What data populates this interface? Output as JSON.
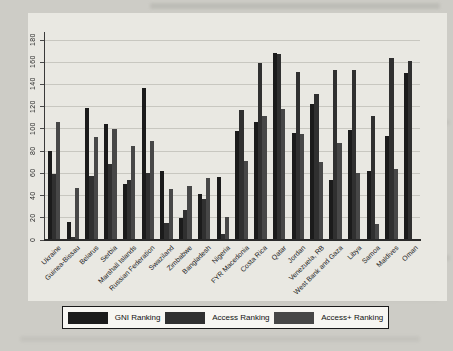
{
  "chart_data": {
    "type": "bar",
    "title": "",
    "xlabel": "",
    "ylabel": "",
    "categories": [
      "Ukraine",
      "Guinea-Bissau",
      "Belarus",
      "Serbia",
      "Marshall Islands",
      "Russian Federation",
      "Swaziland",
      "Zimbabwe",
      "Bangladesh",
      "Nigeria",
      "FYR Macedonia",
      "Costa Rica",
      "Qatar",
      "Jordan",
      "Venezuela, RB",
      "West Bank and Gaza",
      "Libya",
      "Samoa",
      "Maldives",
      "Oman"
    ],
    "series": [
      {
        "name": "GNI Ranking",
        "color": "#1b1b1b",
        "values": [
          80,
          16,
          119,
          104,
          50,
          137,
          62,
          20,
          41,
          57,
          98,
          106,
          168,
          96,
          122,
          54,
          99,
          62,
          94,
          150
        ]
      },
      {
        "name": "Access Ranking",
        "color": "#303030",
        "values": [
          59,
          3,
          58,
          68,
          54,
          60,
          15,
          27,
          37,
          5,
          117,
          159,
          167,
          151,
          131,
          153,
          153,
          112,
          164,
          161
        ]
      },
      {
        "name": "Access+ Ranking",
        "color": "#474747",
        "values": [
          106,
          47,
          93,
          100,
          85,
          89,
          46,
          49,
          56,
          21,
          71,
          112,
          118,
          95,
          70,
          87,
          60,
          14,
          64,
          1
        ]
      }
    ],
    "ylim": [
      0,
      180
    ],
    "yticks": [
      0,
      20,
      40,
      60,
      80,
      100,
      120,
      140,
      160,
      180
    ],
    "grid": true,
    "legend_position": "bottom"
  },
  "colors": {
    "page_bg": "#cdccc6",
    "chart_bg": "#e9e8e2",
    "gridline": "#c8c7c0",
    "axis": "#3a3a3a",
    "legend_bg": "#f7f6f2",
    "legend_border": "#1a1a1a"
  }
}
